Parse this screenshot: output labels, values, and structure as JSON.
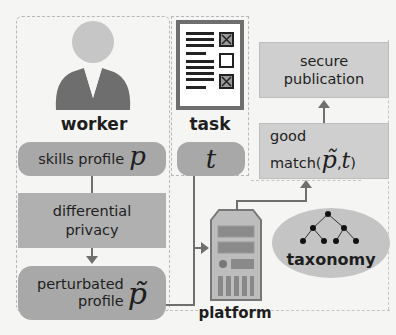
{
  "worker": {
    "label": "worker",
    "skills_profile": "skills profile",
    "skills_symbol": "p",
    "dp_line1": "differential",
    "dp_line2": "privacy",
    "perturbed_line1": "perturbated",
    "perturbed_line2": "profile",
    "perturbed_symbol": "p̃"
  },
  "task": {
    "label": "task",
    "symbol": "t"
  },
  "platform": {
    "label": "platform"
  },
  "taxonomy": {
    "label": "taxonomy"
  },
  "match": {
    "line1": "good",
    "line2_prefix": "match(",
    "line2_p": "p̃",
    "line2_sep": ",",
    "line2_t": "t",
    "line2_suffix": ")"
  },
  "publication": {
    "line1": "secure",
    "line2": "publication"
  },
  "colors": {
    "box_dark": "#a8a8a8",
    "box_light": "#cfcfcf",
    "arrow": "#6f6f6f",
    "dash": "#b8b8b8"
  }
}
